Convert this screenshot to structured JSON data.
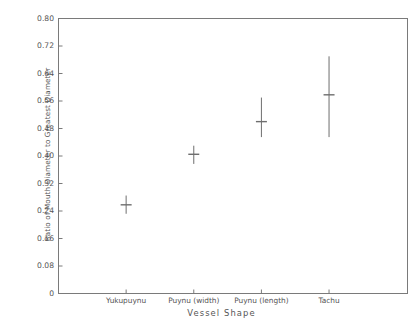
{
  "chart_data": {
    "type": "scatter",
    "title": "",
    "xlabel": "Vessel Shape",
    "ylabel": "Ratio of Mouth Diameter to Greatest Diameter",
    "categories": [
      "Yukupuynu",
      "Puynu (width)",
      "Puynu (length)",
      "Tachu"
    ],
    "ylim": [
      0,
      0.8
    ],
    "yticks": [
      0,
      0.08,
      0.16,
      0.24,
      0.32,
      0.4,
      0.48,
      0.56,
      0.64,
      0.72,
      0.8
    ],
    "ytick_labels": [
      "0",
      "0.08",
      "0.16",
      "0.24",
      "0.32",
      "0.40",
      "0.48",
      "0.56",
      "0.64",
      "0.72",
      "0.80"
    ],
    "grid": false,
    "legend": null,
    "series": [
      {
        "name": "Ratio of Mouth Diameter to Greatest Diameter",
        "marker": "horizontal-tick",
        "values": [
          0.258,
          0.405,
          0.5,
          0.578
        ],
        "lower": [
          0.232,
          0.377,
          0.455,
          0.455
        ],
        "upper": [
          0.285,
          0.43,
          0.57,
          0.69
        ]
      }
    ],
    "points": [
      {
        "category": "Yukupuynu",
        "mean": 0.258,
        "low": 0.232,
        "high": 0.285
      },
      {
        "category": "Puynu (width)",
        "mean": 0.405,
        "low": 0.377,
        "high": 0.43
      },
      {
        "category": "Puynu (length)",
        "mean": 0.5,
        "low": 0.455,
        "high": 0.57
      },
      {
        "category": "Tachu",
        "mean": 0.578,
        "low": 0.455,
        "high": 0.69
      }
    ],
    "colors": {
      "axis": "#7a7a7a",
      "data": "#6e6e6e",
      "text": "#555555",
      "background": "#ffffff"
    }
  },
  "caption": {
    "text": ""
  }
}
